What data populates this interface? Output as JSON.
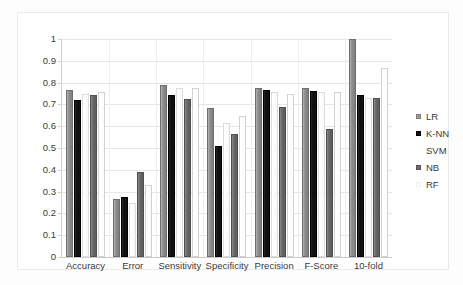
{
  "chart_data": {
    "type": "bar",
    "title": "",
    "subtitle": "",
    "xlabel": "",
    "ylabel": "",
    "ylim": [
      0,
      1
    ],
    "ytick_labels": [
      "0",
      "0.1",
      "0.2",
      "0.3",
      "0.4",
      "0.5",
      "0.6",
      "0.7",
      "0.8",
      "0.9",
      "1"
    ],
    "ytick_values": [
      0,
      0.1,
      0.2,
      0.3,
      0.4,
      0.5,
      0.6,
      0.7,
      0.8,
      0.9,
      1
    ],
    "grid": true,
    "legend_position": "right",
    "categories": [
      "Accuracy",
      "Error",
      "Sensitivity",
      "Specificity",
      "Precision",
      "F-Score",
      "10-fold"
    ],
    "series": [
      {
        "name": "LR",
        "color": "#8f8f8f",
        "values": [
          0.765,
          0.265,
          0.79,
          0.685,
          0.775,
          0.775,
          1.0
        ]
      },
      {
        "name": "K-NN",
        "color": "#111111",
        "values": [
          0.72,
          0.275,
          0.745,
          0.51,
          0.765,
          0.76,
          0.745
        ]
      },
      {
        "name": "SVM",
        "color": "#fcfcfc",
        "values": [
          0.75,
          0.25,
          0.775,
          0.615,
          0.755,
          0.755,
          0.73
        ]
      },
      {
        "name": "NB",
        "color": "#676767",
        "values": [
          0.745,
          0.39,
          0.725,
          0.565,
          0.69,
          0.585,
          0.73
        ]
      },
      {
        "name": "RF",
        "color": "#fcfcfc",
        "values": [
          0.755,
          0.33,
          0.775,
          0.645,
          0.75,
          0.755,
          0.865
        ]
      }
    ]
  },
  "legend": {
    "entries": [
      {
        "label": "LR"
      },
      {
        "label": "K-NN"
      },
      {
        "label": "SVM"
      },
      {
        "label": "NB"
      },
      {
        "label": "RF"
      }
    ]
  }
}
